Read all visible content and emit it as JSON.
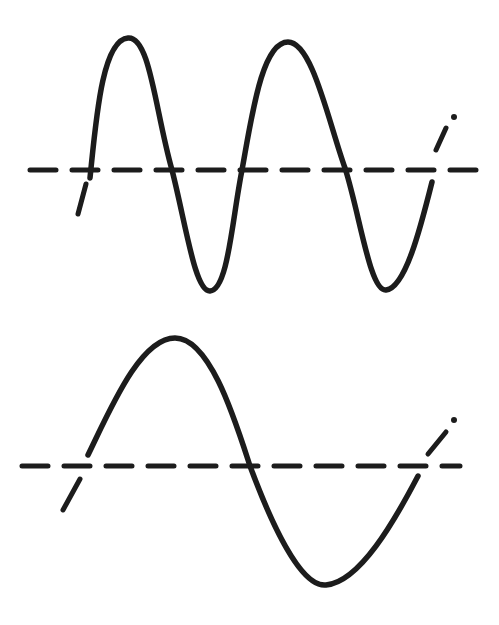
{
  "diagram": {
    "background": "#ffffff",
    "ink_color": "#1c1c1c",
    "panels": [
      {
        "name": "high-frequency-wave",
        "cycles": 2,
        "axis": {
          "x1": 30,
          "x2": 482,
          "y": 170
        },
        "wave_path": "M 90 178 C 96 120, 102 40, 128 38 C 150 36, 155 110, 172 170 C 186 225, 195 292, 210 291 C 228 290, 232 220, 242 170 C 252 115, 262 42, 288 42 C 312 42, 328 120, 345 168 C 360 215, 370 292, 386 290 C 405 288, 420 230, 432 182",
        "start_tick": {
          "x1": 78,
          "y1": 214,
          "x2": 86,
          "y2": 184
        },
        "end_tick": {
          "x1": 436,
          "y1": 150,
          "x2": 446,
          "y2": 128
        },
        "end_dot": {
          "cx": 454,
          "cy": 117
        }
      },
      {
        "name": "low-frequency-wave",
        "cycles": 1,
        "axis": {
          "x1": 22,
          "x2": 460,
          "y": 466
        },
        "wave_path": "M 88 455 C 110 410, 140 338, 175 338 C 210 338, 235 420, 250 466 C 270 520, 300 588, 326 585 C 360 582, 395 520, 418 476",
        "start_tick": {
          "x1": 63,
          "y1": 510,
          "x2": 80,
          "y2": 479
        },
        "end_tick": {
          "x1": 428,
          "y1": 454,
          "x2": 446,
          "y2": 432
        },
        "end_dot": {
          "cx": 454,
          "cy": 420
        }
      }
    ]
  }
}
